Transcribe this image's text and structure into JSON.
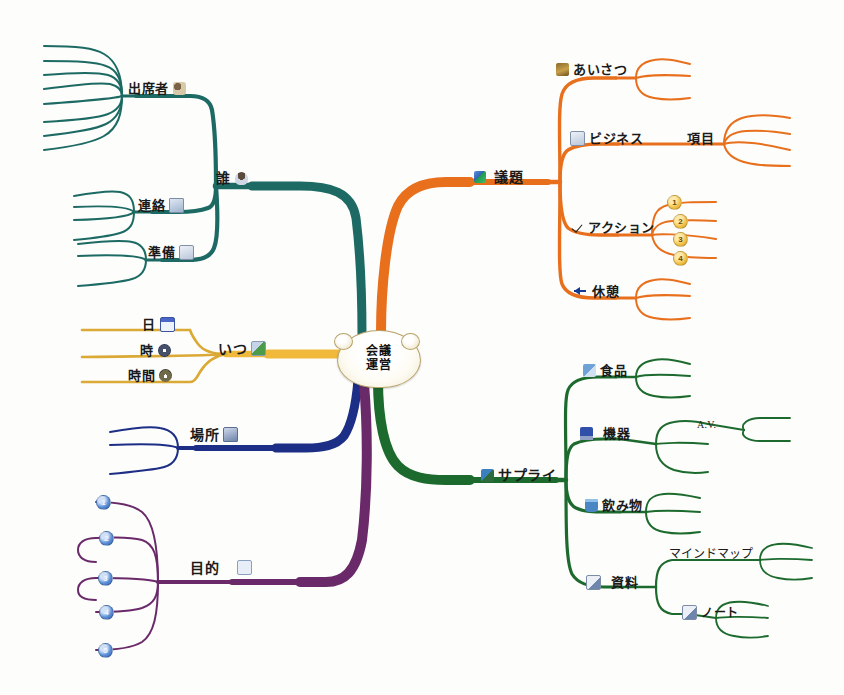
{
  "map": {
    "title_line1": "会議",
    "title_line2": "運営",
    "center_name": "会議運営"
  },
  "branches": [
    {
      "id": "dare",
      "label": "誰",
      "icon": "person-icon",
      "color": "#1d6b63",
      "children": [
        {
          "label": "出席者",
          "icon": "people-icon",
          "leaf_count": 8
        },
        {
          "label": "連絡",
          "icon": "book-icon",
          "leaf_count": 4
        },
        {
          "label": "準備",
          "icon": "sort-icon",
          "leaf_count": 3
        }
      ]
    },
    {
      "id": "itsu",
      "label": "いつ",
      "icon": "when-icon",
      "color": "#f0b93a",
      "children": [
        {
          "label": "日",
          "icon": "calendar-icon",
          "leaf_count": 0
        },
        {
          "label": "時",
          "icon": "clock-icon",
          "leaf_count": 0
        },
        {
          "label": "時間",
          "icon": "timer-icon",
          "leaf_count": 0
        }
      ]
    },
    {
      "id": "basho",
      "label": "場所",
      "icon": "place-icon",
      "color": "#1f2f86",
      "children": [],
      "leaf_count": 3
    },
    {
      "id": "mokuteki",
      "label": "目的",
      "icon": "purpose-icon",
      "color": "#6b2a6b",
      "children": [],
      "leaf_count": 5,
      "badges": [
        "1",
        "2",
        "3",
        "4",
        "5"
      ],
      "badge_style": "blue"
    },
    {
      "id": "gidai",
      "label": "議題",
      "icon": "diamond-icon",
      "color": "#e8701e",
      "children": [
        {
          "label": "あいさつ",
          "icon": "camera-icon",
          "leaf_count": 3
        },
        {
          "label": "ビジネス",
          "label2": "項目",
          "icon": "note-icon",
          "leaf_count": 4
        },
        {
          "label": "アクション",
          "icon": "check-icon",
          "leaf_count": 4,
          "badges": [
            "1",
            "2",
            "3",
            "4"
          ],
          "badge_style": "gold"
        },
        {
          "label": "休憩",
          "icon": "arrow-left-icon",
          "leaf_count": 3
        }
      ]
    },
    {
      "id": "supply",
      "label": "サプライ",
      "icon": "supply-icon",
      "color": "#1d6b2e",
      "children": [
        {
          "label": "食品",
          "icon": "food-icon",
          "leaf_count": 3
        },
        {
          "label": "機器",
          "icon": "monitor-icon",
          "leaf_count": 3,
          "sub": {
            "label": "A.V.",
            "leaf_count": 2
          }
        },
        {
          "label": "飲み物",
          "icon": "drink-icon",
          "leaf_count": 3
        },
        {
          "label": "資料",
          "icon": "doc-icon",
          "children": [
            {
              "label": "マインドマップ",
              "leaf_count": 3
            },
            {
              "label": "ノート",
              "icon": "doc-icon",
              "leaf_count": 3
            }
          ]
        }
      ]
    }
  ],
  "labels": {
    "dare": "誰",
    "shussekisha": "出席者",
    "renraku": "連絡",
    "junbi": "準備",
    "itsu": "いつ",
    "hi": "日",
    "ji": "時",
    "jikan": "時間",
    "basho": "場所",
    "mokuteki": "目的",
    "gidai": "議題",
    "aisatsu": "あいさつ",
    "business": "ビジネス",
    "koumoku": "項目",
    "action": "アクション",
    "kyuukei": "休憩",
    "supply": "サプライ",
    "shokuhin": "食品",
    "kiki": "機器",
    "av": "A.V.",
    "nomimono": "飲み物",
    "shiryou": "資料",
    "mindmap": "マインドマップ",
    "note": "ノート"
  },
  "badges": {
    "action": [
      "1",
      "2",
      "3",
      "4"
    ],
    "mokuteki": [
      "1",
      "2",
      "3",
      "4",
      "5"
    ]
  },
  "colors": {
    "teal": "#1d6b63",
    "yellow": "#f0b93a",
    "navy": "#1f2f86",
    "purple": "#6b2a6b",
    "orange": "#e8701e",
    "green": "#1d6b2e",
    "center_outline": "#b7a269"
  }
}
